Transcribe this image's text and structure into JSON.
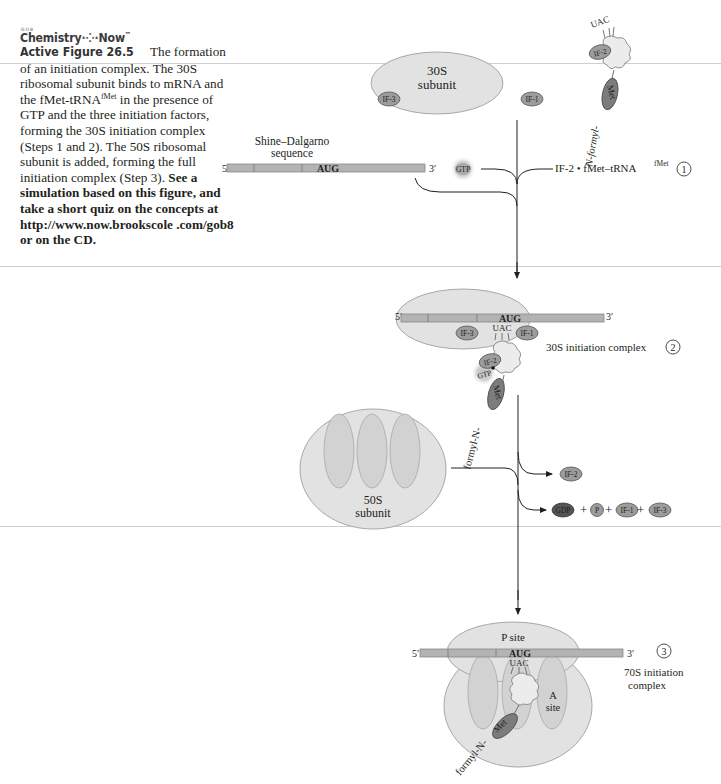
{
  "header": {
    "logo_small": "GOB",
    "logo_text": "Chemistry",
    "logo_text2": "Now",
    "logo_tm": "™"
  },
  "caption": {
    "figure_label": "Active Figure 26.5",
    "text_part1": "The formation of an initiation complex. The 30S ribosomal subunit binds to mRNA and the fMet-tRNA",
    "text_sup1": "fMet",
    "text_part2": " in the presence of GTP and the three initiation factors, forming the 30S initiation complex (Steps 1 and 2). The 50S ribosomal subunit is added, forming the full initiation complex (Step 3). ",
    "bold_text": "See a simulation based on this figure, and take a short quiz on the concepts at http://www.now.brookscole .com/gob8 or on the CD."
  },
  "diagram": {
    "step1": {
      "subunit_30s_label1": "30S",
      "subunit_30s_label2": "subunit",
      "if3": "IF-3",
      "if1": "IF-1",
      "if2": "IF-2",
      "trna_anticodon": "UAC",
      "met": "Met",
      "formyl_label": "N-formyl-",
      "shine_label1": "Shine–Dalgarno",
      "shine_label2": "sequence",
      "mrna_5": "5′",
      "mrna_3": "3′",
      "codon": "AUG",
      "gtp": "GTP",
      "reagent": "IF-2 • fMet–tRNA",
      "reagent_sup": "fMet",
      "step_number": "1"
    },
    "step2": {
      "mrna_5": "5′",
      "mrna_3": "3′",
      "codon": "AUG",
      "anticodon": "UAC",
      "if3": "IF-3",
      "if1": "IF-1",
      "if2": "IF-2",
      "gtp": "GTP",
      "met": "Met",
      "formyl_label": "formyl-N-",
      "complex_label": "30S initiation complex",
      "step_number": "2"
    },
    "release": {
      "subunit_50s_label1": "50S",
      "subunit_50s_label2": "subunit",
      "if2": "IF-2",
      "gdp": "GDP",
      "plus": "+",
      "p": "P",
      "if1": "IF-1",
      "if3": "IF-3"
    },
    "step3": {
      "p_site": "P site",
      "a_site1": "A",
      "a_site2": "site",
      "mrna_5": "5′",
      "mrna_3": "3′",
      "codon": "AUG",
      "anticodon": "UAC",
      "met": "Met",
      "formyl_label": "formyl-N-",
      "complex_label1": "70S initiation",
      "complex_label2": "complex",
      "step_number": "3"
    }
  }
}
